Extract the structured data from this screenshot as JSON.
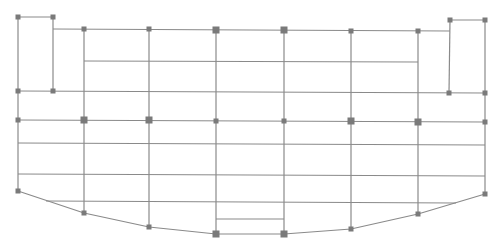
{
  "diagram": {
    "type": "structural-grid-plan",
    "caption_cropped": "",
    "colors": {
      "background": "#ffffff",
      "line": "#8a8a8a",
      "node": "#7a7a7a"
    },
    "stroke_width": 1.2,
    "nodes": [
      {
        "id": "n1",
        "x": 18,
        "y": 17,
        "size": "small"
      },
      {
        "id": "n2",
        "x": 53,
        "y": 17,
        "size": "small"
      },
      {
        "id": "n3",
        "x": 18,
        "y": 91,
        "size": "small"
      },
      {
        "id": "n4",
        "x": 53,
        "y": 91,
        "size": "small"
      },
      {
        "id": "n5",
        "x": 84,
        "y": 29,
        "size": "small"
      },
      {
        "id": "n6",
        "x": 149,
        "y": 29,
        "size": "small"
      },
      {
        "id": "n7",
        "x": 216,
        "y": 30,
        "size": "large"
      },
      {
        "id": "n8",
        "x": 284,
        "y": 30,
        "size": "large"
      },
      {
        "id": "n9",
        "x": 351,
        "y": 31,
        "size": "small"
      },
      {
        "id": "n10",
        "x": 418,
        "y": 31,
        "size": "small"
      },
      {
        "id": "n11",
        "x": 450,
        "y": 20,
        "size": "small"
      },
      {
        "id": "n12",
        "x": 485,
        "y": 20,
        "size": "small"
      },
      {
        "id": "n13",
        "x": 449,
        "y": 93,
        "size": "small"
      },
      {
        "id": "n14",
        "x": 485,
        "y": 93,
        "size": "small"
      },
      {
        "id": "n15",
        "x": 18,
        "y": 120,
        "size": "small"
      },
      {
        "id": "n16",
        "x": 84,
        "y": 120,
        "size": "large"
      },
      {
        "id": "n17",
        "x": 149,
        "y": 120,
        "size": "large"
      },
      {
        "id": "n18",
        "x": 216,
        "y": 121,
        "size": "small"
      },
      {
        "id": "n19",
        "x": 284,
        "y": 121,
        "size": "small"
      },
      {
        "id": "n20",
        "x": 351,
        "y": 121,
        "size": "large"
      },
      {
        "id": "n21",
        "x": 418,
        "y": 122,
        "size": "large"
      },
      {
        "id": "n22",
        "x": 485,
        "y": 122,
        "size": "small"
      },
      {
        "id": "n23",
        "x": 18,
        "y": 191,
        "size": "small"
      },
      {
        "id": "n24",
        "x": 84,
        "y": 213,
        "size": "small"
      },
      {
        "id": "n25",
        "x": 149,
        "y": 227,
        "size": "small"
      },
      {
        "id": "n26",
        "x": 216,
        "y": 234,
        "size": "large"
      },
      {
        "id": "n27",
        "x": 284,
        "y": 234,
        "size": "large"
      },
      {
        "id": "n28",
        "x": 351,
        "y": 229,
        "size": "small"
      },
      {
        "id": "n29",
        "x": 418,
        "y": 214,
        "size": "small"
      },
      {
        "id": "n30",
        "x": 485,
        "y": 194,
        "size": "small"
      }
    ],
    "lines": [
      {
        "x1": 18,
        "y1": 17,
        "x2": 53,
        "y2": 17
      },
      {
        "x1": 18,
        "y1": 17,
        "x2": 18,
        "y2": 191
      },
      {
        "x1": 53,
        "y1": 17,
        "x2": 53,
        "y2": 91
      },
      {
        "x1": 53,
        "y1": 29,
        "x2": 450,
        "y2": 31
      },
      {
        "x1": 84,
        "y1": 61,
        "x2": 418,
        "y2": 62
      },
      {
        "x1": 18,
        "y1": 91,
        "x2": 485,
        "y2": 93
      },
      {
        "x1": 18,
        "y1": 120,
        "x2": 485,
        "y2": 122
      },
      {
        "x1": 18,
        "y1": 143,
        "x2": 485,
        "y2": 145
      },
      {
        "x1": 18,
        "y1": 174,
        "x2": 485,
        "y2": 176
      },
      {
        "x1": 46,
        "y1": 201,
        "x2": 456,
        "y2": 203
      },
      {
        "x1": 216,
        "y1": 219,
        "x2": 284,
        "y2": 219
      },
      {
        "x1": 450,
        "y1": 20,
        "x2": 485,
        "y2": 20
      },
      {
        "x1": 450,
        "y1": 20,
        "x2": 449,
        "y2": 93
      },
      {
        "x1": 485,
        "y1": 20,
        "x2": 485,
        "y2": 194
      },
      {
        "x1": 84,
        "y1": 29,
        "x2": 84,
        "y2": 213
      },
      {
        "x1": 149,
        "y1": 29,
        "x2": 149,
        "y2": 227
      },
      {
        "x1": 216,
        "y1": 30,
        "x2": 216,
        "y2": 234
      },
      {
        "x1": 284,
        "y1": 30,
        "x2": 284,
        "y2": 234
      },
      {
        "x1": 351,
        "y1": 31,
        "x2": 351,
        "y2": 229
      },
      {
        "x1": 418,
        "y1": 31,
        "x2": 418,
        "y2": 214
      }
    ],
    "bottom_curve": [
      [
        18,
        191
      ],
      [
        84,
        213
      ],
      [
        149,
        227
      ],
      [
        216,
        234
      ],
      [
        284,
        234
      ],
      [
        351,
        229
      ],
      [
        418,
        214
      ],
      [
        485,
        194
      ]
    ]
  }
}
